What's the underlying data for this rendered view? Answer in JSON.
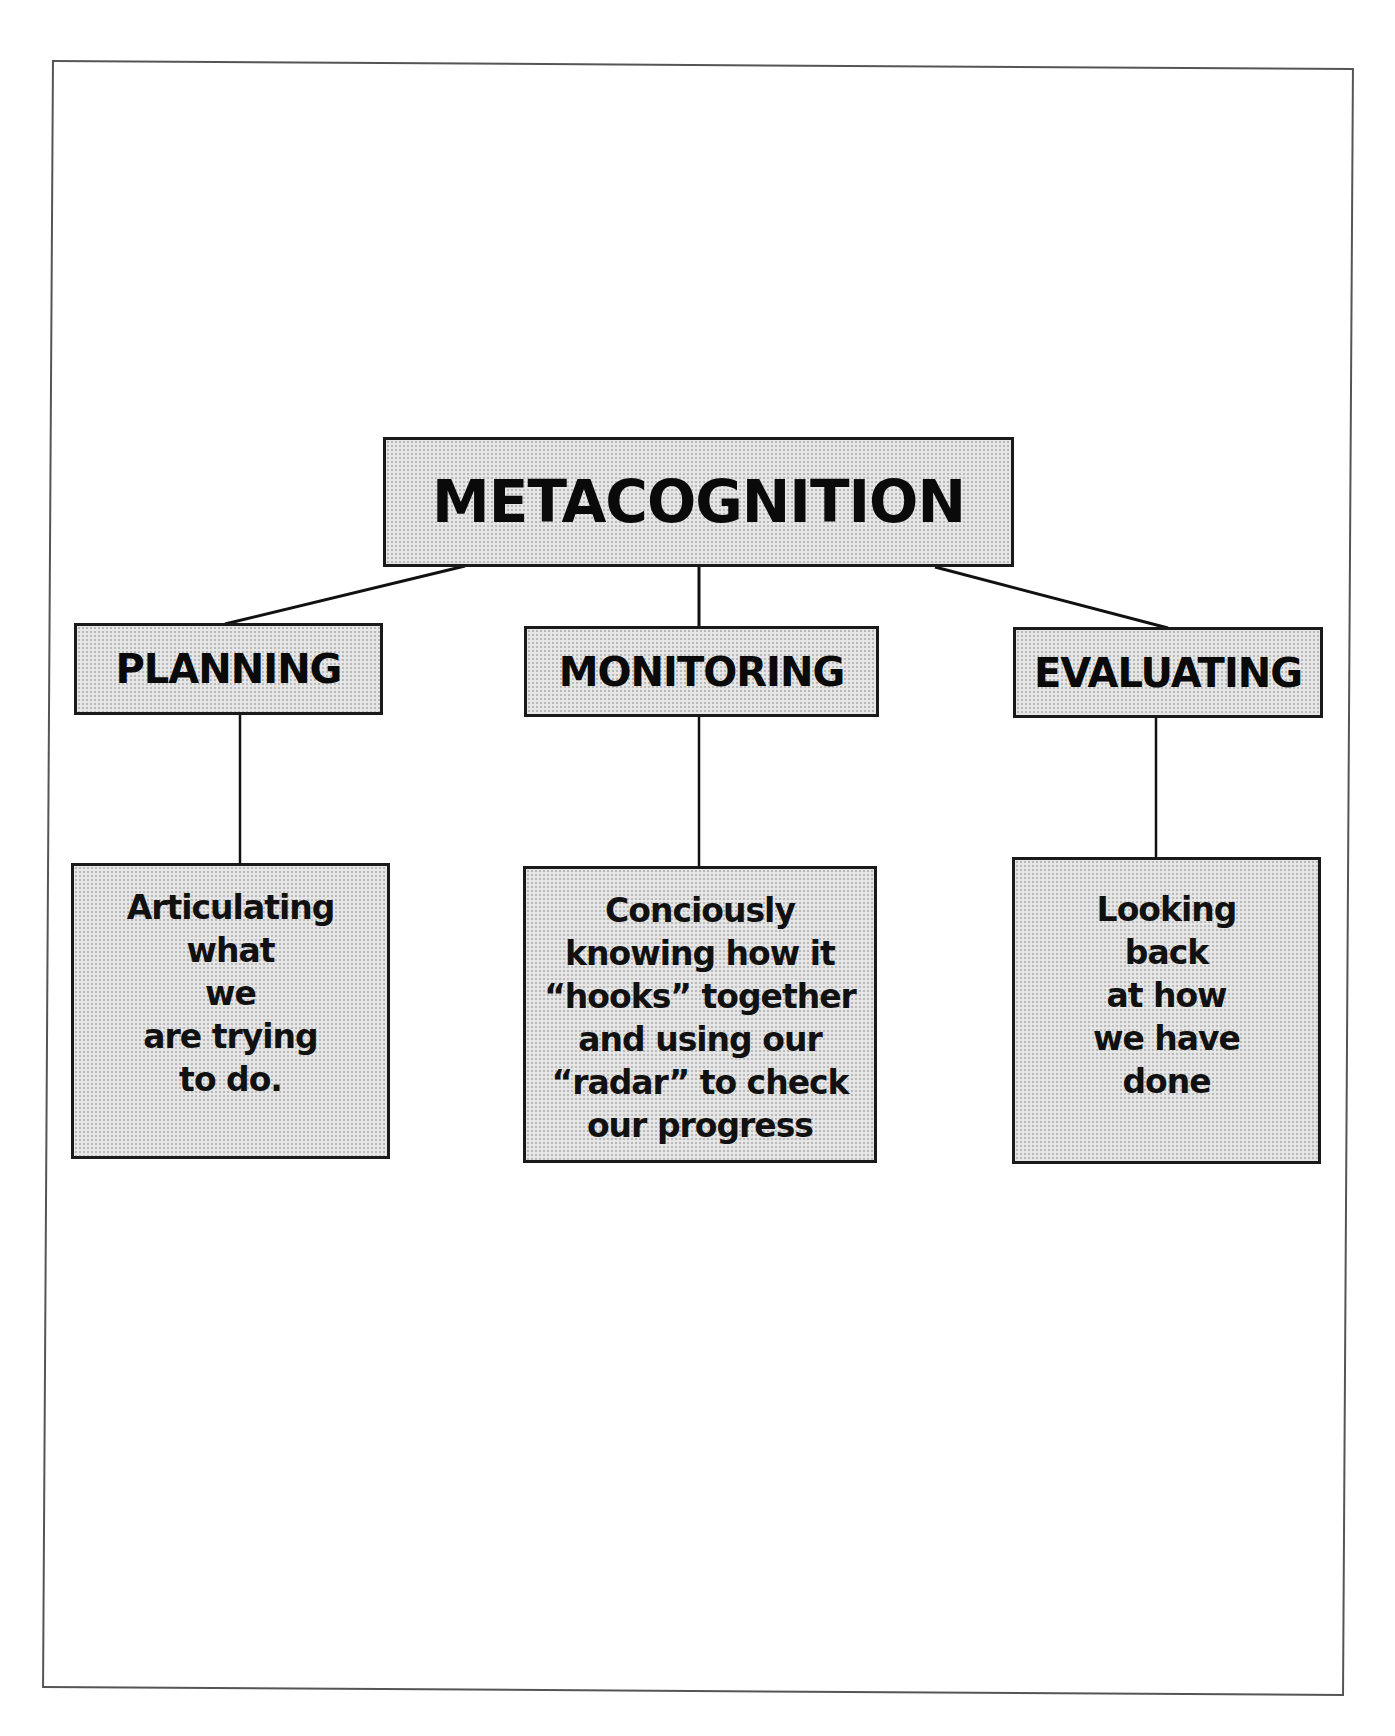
{
  "diagram": {
    "type": "hierarchy",
    "root": {
      "label": "METACOGNITION"
    },
    "categories": [
      {
        "label": "PLANNING",
        "description": "Articulating\nwhat\nwe\nare trying\nto do."
      },
      {
        "label": "MONITORING",
        "description": "Conciously\nknowing how it\n“hooks” together\nand using our\n“radar” to check\nour progress"
      },
      {
        "label": "EVALUATING",
        "description": "Looking\nback\nat how\nwe have\ndone"
      }
    ]
  },
  "colors": {
    "box_fill": "#e6e6e6",
    "box_border": "#1a1a1a",
    "frame_border": "#555555",
    "text": "#0a0a0a",
    "background": "#ffffff"
  }
}
